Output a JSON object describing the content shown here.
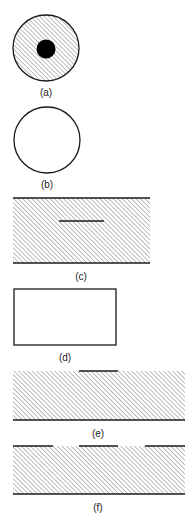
{
  "figure": {
    "colors": {
      "stroke": "#1a1a1a",
      "hatch": "#8a8a8a",
      "background": "#ffffff",
      "dot": "#000000"
    },
    "panels": [
      {
        "id": "a",
        "label": "(a)",
        "shape": "hatched circle with solid black center dot"
      },
      {
        "id": "b",
        "label": "(b)",
        "shape": "empty circle"
      },
      {
        "id": "c",
        "label": "(c)",
        "shape": "hatched band between two lines with short inner line"
      },
      {
        "id": "d",
        "label": "(d)",
        "shape": "empty rectangle"
      },
      {
        "id": "e",
        "label": "(e)",
        "shape": "hatched band with short top segment and bottom line"
      },
      {
        "id": "f",
        "label": "(f)",
        "shape": "hatched band with three top segments and bottom line"
      }
    ]
  }
}
